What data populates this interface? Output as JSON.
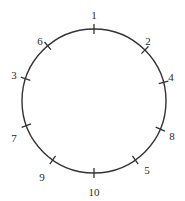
{
  "diagram": {
    "type": "circle-with-tick-marks",
    "center": [
      94,
      101
    ],
    "radius": 72,
    "stroke_color": "#333333",
    "background": "#ffffff",
    "ticks": [
      {
        "label": "1",
        "angle": 0,
        "lx": 94,
        "ly": 16
      },
      {
        "label": "2",
        "angle": 45,
        "lx": 148,
        "ly": 42
      },
      {
        "label": "4",
        "angle": 75,
        "lx": 171,
        "ly": 78
      },
      {
        "label": "8",
        "angle": 113,
        "lx": 172,
        "ly": 137
      },
      {
        "label": "5",
        "angle": 145,
        "lx": 147,
        "ly": 171
      },
      {
        "label": "10",
        "angle": 180,
        "lx": 94,
        "ly": 193
      },
      {
        "label": "9",
        "angle": 215,
        "lx": 42,
        "ly": 178
      },
      {
        "label": "7",
        "angle": 250,
        "lx": 14,
        "ly": 139
      },
      {
        "label": "3",
        "angle": 288,
        "lx": 14,
        "ly": 76
      },
      {
        "label": "6",
        "angle": 320,
        "lx": 40,
        "ly": 42
      }
    ]
  }
}
